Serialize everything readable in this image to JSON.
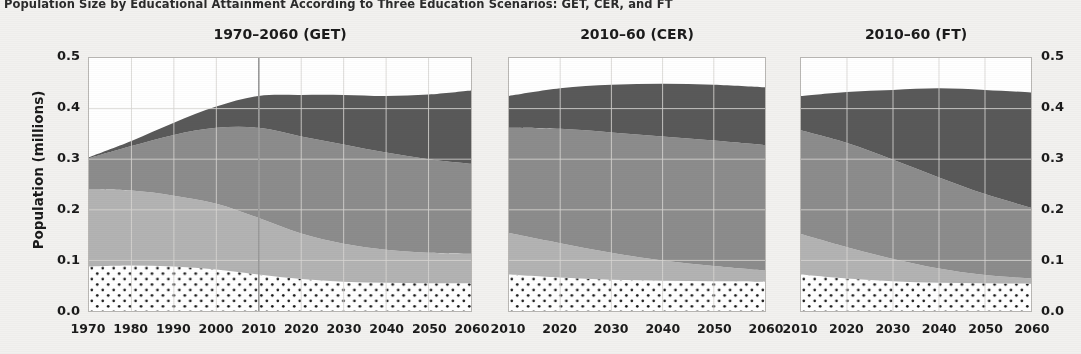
{
  "figure": {
    "title": "Population Size by Educational Attainment According to Three Education Scenarios: GET, CER, and FT",
    "ylabel": "Population (millions)"
  },
  "axis": {
    "yticks": [
      "0.0",
      "0.1",
      "0.2",
      "0.3",
      "0.4",
      "0.5"
    ],
    "yticks_right": [
      "0.0",
      "0.1",
      "0.2",
      "0.3",
      "0.4",
      "0.5"
    ]
  },
  "panels": [
    {
      "title": "1970–2060 (GET)",
      "xticks": [
        "1970",
        "1980",
        "1990",
        "2000",
        "2010",
        "2020",
        "2030",
        "2040",
        "2050",
        "2060"
      ]
    },
    {
      "title": "2010–60 (CER)",
      "xticks": [
        "2010",
        "2020",
        "2030",
        "2040",
        "2050",
        "2060"
      ]
    },
    {
      "title": "2010–60 (FT)",
      "xticks": [
        "2010",
        "2020",
        "2030",
        "2040",
        "2050",
        "2060"
      ]
    }
  ],
  "colors": {
    "no_education": "#ffffff",
    "primary": "#b3b3b3",
    "secondary": "#8c8c8c",
    "tertiary": "#595959",
    "plot_background": "#ffffff",
    "page_background": "#f2f1ef",
    "gridline": "#d8d6d3",
    "axis": "#b9b7b4",
    "reference_line": "#9a9a9a",
    "text": "#1b1b1b"
  },
  "chart_data": {
    "type": "area",
    "title": "Population Size by Educational Attainment According to Three Education Scenarios: GET, CER, and FT",
    "xlabel": "",
    "ylabel": "Population (millions)",
    "ylim": [
      0.0,
      0.5
    ],
    "grid": true,
    "legend": "none",
    "stacked": true,
    "series_order": [
      "No Education",
      "Primary",
      "Secondary",
      "Tertiary"
    ],
    "reference_lines": [
      {
        "panel": "1970–2060 (GET)",
        "x": 2010,
        "label": ""
      }
    ],
    "panels": [
      {
        "name": "1970–2060 (GET)",
        "xlim": [
          1970,
          2060
        ],
        "x": [
          1970,
          1980,
          1990,
          2000,
          2010,
          2020,
          2030,
          2040,
          2050,
          2060
        ],
        "series": [
          {
            "name": "No Education",
            "values": [
              0.088,
              0.09,
              0.088,
              0.082,
              0.072,
              0.063,
              0.058,
              0.056,
              0.055,
              0.055
            ]
          },
          {
            "name": "Primary",
            "values": [
              0.152,
              0.148,
              0.14,
              0.13,
              0.112,
              0.09,
              0.075,
              0.065,
              0.06,
              0.058
            ]
          },
          {
            "name": "Secondary",
            "values": [
              0.062,
              0.088,
              0.12,
              0.15,
              0.178,
              0.192,
              0.196,
              0.192,
              0.185,
              0.178
            ]
          },
          {
            "name": "Tertiary",
            "values": [
              0.002,
              0.01,
              0.024,
              0.042,
              0.063,
              0.082,
              0.098,
              0.112,
              0.128,
              0.145
            ]
          }
        ],
        "totals": [
          0.304,
          0.336,
          0.372,
          0.404,
          0.425,
          0.427,
          0.427,
          0.425,
          0.428,
          0.436
        ]
      },
      {
        "name": "2010–60 (CER)",
        "xlim": [
          2010,
          2060
        ],
        "x": [
          2010,
          2020,
          2030,
          2040,
          2050,
          2060
        ],
        "series": [
          {
            "name": "No Education",
            "values": [
              0.072,
              0.066,
              0.062,
              0.06,
              0.059,
              0.058
            ]
          },
          {
            "name": "Primary",
            "values": [
              0.082,
              0.068,
              0.053,
              0.04,
              0.03,
              0.022
            ]
          },
          {
            "name": "Secondary",
            "values": [
              0.208,
              0.226,
              0.238,
              0.245,
              0.248,
              0.248
            ]
          },
          {
            "name": "Tertiary",
            "values": [
              0.063,
              0.08,
              0.094,
              0.104,
              0.11,
              0.114
            ]
          }
        ],
        "totals": [
          0.425,
          0.44,
          0.447,
          0.449,
          0.447,
          0.442
        ]
      },
      {
        "name": "2010–60 (FT)",
        "xlim": [
          2010,
          2060
        ],
        "x": [
          2010,
          2020,
          2030,
          2040,
          2050,
          2060
        ],
        "series": [
          {
            "name": "No Education",
            "values": [
              0.072,
              0.064,
              0.059,
              0.056,
              0.055,
              0.054
            ]
          },
          {
            "name": "Primary",
            "values": [
              0.08,
              0.062,
              0.044,
              0.028,
              0.016,
              0.01
            ]
          },
          {
            "name": "Secondary",
            "values": [
              0.205,
              0.206,
              0.196,
              0.18,
              0.16,
              0.14
            ]
          },
          {
            "name": "Tertiary",
            "values": [
              0.068,
              0.101,
              0.138,
              0.176,
              0.206,
              0.228
            ]
          }
        ],
        "totals": [
          0.425,
          0.433,
          0.437,
          0.44,
          0.437,
          0.432
        ]
      }
    ]
  }
}
